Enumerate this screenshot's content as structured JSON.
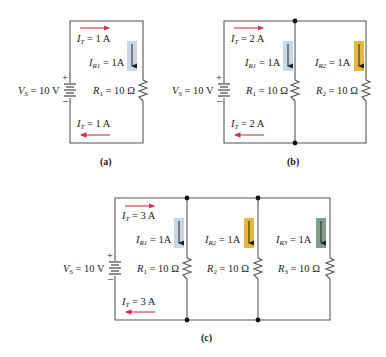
{
  "figure": {
    "colors": {
      "wire": "#555555",
      "total_current_arrow": "#d03050",
      "branch1_indicator": "#c9d6e3",
      "branch2_indicator": "#e7b93a",
      "branch3_indicator": "#7f9f8c"
    },
    "circuits": [
      {
        "id": "a",
        "caption": "(a)",
        "source": {
          "label": "V",
          "sub": "S",
          "value": " = 10 V",
          "plus": "+",
          "minus": "–"
        },
        "total_current_top": {
          "label": "I",
          "sub": "T",
          "value": " = 1 A"
        },
        "total_current_bottom": {
          "label": "I",
          "sub": "T",
          "value": " = 1 A"
        },
        "branches": [
          {
            "current_label": "I",
            "current_sub": "R1",
            "current_value": " = 1A",
            "resistor_label": "R",
            "resistor_sub": "1",
            "resistor_value": " = 10 Ω"
          }
        ]
      },
      {
        "id": "b",
        "caption": "(b)",
        "source": {
          "label": "V",
          "sub": "S",
          "value": " = 10 V",
          "plus": "+",
          "minus": "–"
        },
        "total_current_top": {
          "label": "I",
          "sub": "T",
          "value": " = 2 A"
        },
        "total_current_bottom": {
          "label": "I",
          "sub": "T",
          "value": " = 2 A"
        },
        "branches": [
          {
            "current_label": "I",
            "current_sub": "R1",
            "current_value": " = 1A",
            "resistor_label": "R",
            "resistor_sub": "1",
            "resistor_value": " = 10 Ω"
          },
          {
            "current_label": "I",
            "current_sub": "R2",
            "current_value": " = 1A",
            "resistor_label": "R",
            "resistor_sub": "2",
            "resistor_value": " = 10 Ω"
          }
        ]
      },
      {
        "id": "c",
        "caption": "(c)",
        "source": {
          "label": "V",
          "sub": "S",
          "value": " = 10 V",
          "plus": "+",
          "minus": "–"
        },
        "total_current_top": {
          "label": "I",
          "sub": "T",
          "value": " = 3 A"
        },
        "total_current_bottom": {
          "label": "I",
          "sub": "T",
          "value": " = 3 A"
        },
        "branches": [
          {
            "current_label": "I",
            "current_sub": "R1",
            "current_value": " = 1A",
            "resistor_label": "R",
            "resistor_sub": "1",
            "resistor_value": " = 10 Ω"
          },
          {
            "current_label": "I",
            "current_sub": "R2",
            "current_value": " = 1A",
            "resistor_label": "R",
            "resistor_sub": "2",
            "resistor_value": " = 10 Ω"
          },
          {
            "current_label": "I",
            "current_sub": "R3",
            "current_value": " = 1A",
            "resistor_label": "R",
            "resistor_sub": "3",
            "resistor_value": " = 10 Ω"
          }
        ]
      }
    ]
  }
}
